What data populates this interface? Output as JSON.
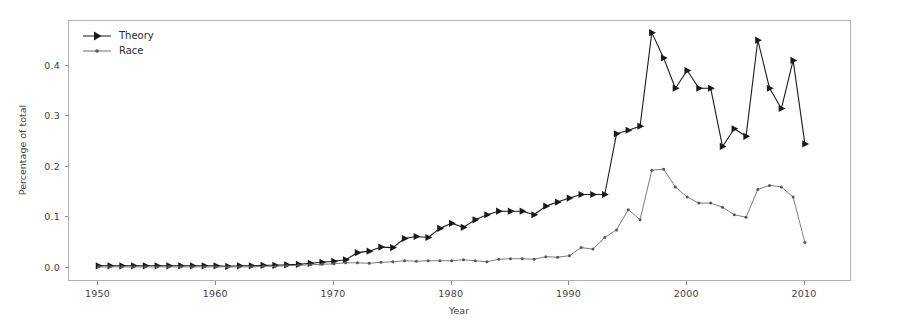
{
  "chart_data": {
    "type": "line",
    "title": "",
    "xlabel": "Year",
    "ylabel": "Percentage of total",
    "xlim": [
      1947.5,
      2014.0
    ],
    "ylim": [
      -0.028,
      0.488
    ],
    "xticks": [
      1950,
      1960,
      1970,
      1980,
      1990,
      2000,
      2010
    ],
    "xticklabels": [
      "1950",
      "1960",
      "1970",
      "1980",
      "1990",
      "2000",
      "2010"
    ],
    "yticks": [
      0.0,
      0.1,
      0.2,
      0.3,
      0.4
    ],
    "yticklabels": [
      "0.0",
      "0.1",
      "0.2",
      "0.3",
      "0.4"
    ],
    "grid": false,
    "legend_position": "upper left",
    "x": [
      1950,
      1951,
      1952,
      1953,
      1954,
      1955,
      1956,
      1957,
      1958,
      1959,
      1960,
      1961,
      1962,
      1963,
      1964,
      1965,
      1966,
      1967,
      1968,
      1969,
      1970,
      1971,
      1972,
      1973,
      1974,
      1975,
      1976,
      1977,
      1978,
      1979,
      1980,
      1981,
      1982,
      1983,
      1984,
      1985,
      1986,
      1987,
      1988,
      1989,
      1990,
      1991,
      1992,
      1993,
      1994,
      1995,
      1996,
      1997,
      1998,
      1999,
      2000,
      2001,
      2002,
      2003,
      2004,
      2005,
      2006,
      2007,
      2008,
      2009,
      2010
    ],
    "series": [
      {
        "name": "Theory",
        "color": "#1a1a1a",
        "marker": "triangle-right",
        "values": [
          0.004,
          0.004,
          0.004,
          0.004,
          0.004,
          0.004,
          0.004,
          0.004,
          0.004,
          0.004,
          0.004,
          0.003,
          0.004,
          0.004,
          0.005,
          0.005,
          0.006,
          0.007,
          0.009,
          0.011,
          0.013,
          0.016,
          0.03,
          0.033,
          0.041,
          0.04,
          0.058,
          0.062,
          0.06,
          0.078,
          0.088,
          0.08,
          0.095,
          0.105,
          0.112,
          0.112,
          0.112,
          0.105,
          0.122,
          0.13,
          0.138,
          0.145,
          0.145,
          0.145,
          0.265,
          0.272,
          0.28,
          0.465,
          0.415,
          0.355,
          0.39,
          0.355,
          0.355,
          0.24,
          0.275,
          0.26,
          0.45,
          0.355,
          0.315,
          0.41,
          0.245
        ]
      },
      {
        "name": "Race",
        "color": "#6e6e6e",
        "marker": "dot",
        "values": [
          0.002,
          0.002,
          0.002,
          0.002,
          0.002,
          0.002,
          0.002,
          0.002,
          0.002,
          0.002,
          0.002,
          0.002,
          0.002,
          0.002,
          0.003,
          0.003,
          0.004,
          0.005,
          0.006,
          0.007,
          0.008,
          0.01,
          0.01,
          0.009,
          0.011,
          0.012,
          0.014,
          0.013,
          0.014,
          0.014,
          0.014,
          0.016,
          0.014,
          0.012,
          0.017,
          0.018,
          0.018,
          0.017,
          0.022,
          0.021,
          0.024,
          0.04,
          0.037,
          0.06,
          0.075,
          0.115,
          0.095,
          0.193,
          0.195,
          0.16,
          0.14,
          0.128,
          0.128,
          0.12,
          0.105,
          0.1,
          0.155,
          0.163,
          0.16,
          0.14,
          0.05
        ]
      }
    ]
  },
  "legend": {
    "items": [
      {
        "label": "Theory"
      },
      {
        "label": "Race"
      }
    ]
  },
  "axes": {
    "xlabel": "Year",
    "ylabel": "Percentage of total"
  }
}
